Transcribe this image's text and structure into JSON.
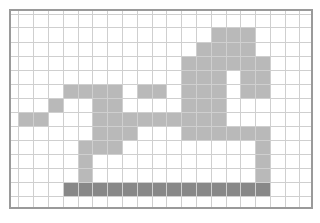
{
  "board": {
    "columns": 21,
    "rows": 15,
    "col_edges": [
      0,
      8,
      23,
      38,
      53,
      68,
      82,
      97,
      112,
      127,
      142,
      156,
      171,
      186,
      201,
      216,
      230,
      245,
      260,
      275,
      289,
      300
    ],
    "row_edges": [
      0,
      4,
      17,
      32,
      46,
      60,
      74,
      88,
      102,
      116,
      130,
      144,
      158,
      172,
      186,
      196
    ],
    "colors": {
      "empty": "#ffffff",
      "filled": "#b9b9b9",
      "dark": "#888888",
      "grid_line": "#cfcfcf",
      "border": "#9a9a9a"
    },
    "filled_cells": [
      [
        2,
        [
          14,
          15,
          16
        ]
      ],
      [
        3,
        [
          13,
          14,
          15,
          16
        ]
      ],
      [
        4,
        [
          12,
          13,
          14,
          15,
          16,
          17
        ]
      ],
      [
        5,
        [
          12,
          13,
          14,
          16,
          17
        ]
      ],
      [
        6,
        [
          4,
          5,
          6,
          7,
          9,
          10,
          12,
          13,
          14,
          16,
          17
        ]
      ],
      [
        7,
        [
          3,
          6,
          7,
          12,
          13,
          14
        ]
      ],
      [
        8,
        [
          1,
          2,
          6,
          7,
          8,
          9,
          10,
          11,
          12,
          13,
          14
        ]
      ],
      [
        9,
        [
          6,
          7,
          8,
          12,
          13,
          14,
          15,
          16,
          17
        ]
      ],
      [
        10,
        [
          5,
          6,
          7,
          17
        ]
      ],
      [
        11,
        [
          5,
          17
        ]
      ],
      [
        12,
        [
          5,
          17
        ]
      ]
    ],
    "dark_cells": [
      [
        13,
        [
          4,
          5,
          6,
          7,
          8,
          9,
          10,
          11,
          12,
          13,
          14,
          15,
          16,
          17
        ]
      ]
    ]
  }
}
